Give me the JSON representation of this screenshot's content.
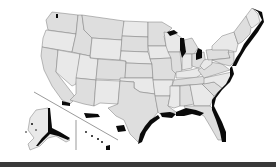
{
  "map": {
    "title": "",
    "subject": "United States map with coastal regions highlighted",
    "colors": {
      "background": "#ffffff",
      "state_fill": "#dedede",
      "state_fill_alt": "#e9e9e9",
      "state_border": "#7a7a7a",
      "coastal_highlight": "#0a0a0a",
      "bottom_bar": "#3a3a3a"
    },
    "insets": [
      "Alaska",
      "Hawaii"
    ],
    "highlighted_regions": [
      "Atlantic coast",
      "Gulf coast",
      "Great Lakes shoreline",
      "Southern California coast",
      "Alaska coast",
      "Hawaii"
    ]
  }
}
